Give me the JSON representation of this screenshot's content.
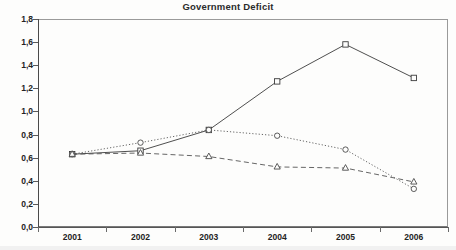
{
  "chart_data": {
    "type": "line",
    "title": "Government Deficit",
    "xlabel": "",
    "ylabel": "",
    "categories": [
      "2001",
      "2002",
      "2003",
      "2004",
      "2005",
      "2006"
    ],
    "ylim": [
      0.0,
      1.8
    ],
    "ytick_labels": [
      "0,0",
      "0,2",
      "0,4",
      "0,6",
      "0,8",
      "1,0",
      "1,2",
      "1,4",
      "1,6",
      "1,8"
    ],
    "ytick_values": [
      0.0,
      0.2,
      0.4,
      0.6,
      0.8,
      1.0,
      1.2,
      1.4,
      1.6,
      1.8
    ],
    "ytick_step": 0.2,
    "grid": false,
    "legend": "none",
    "decimal_separator": ",",
    "series": [
      {
        "name": "series-square-solid",
        "marker": "square",
        "line_style": "solid",
        "color": "#3b3b3b",
        "values": [
          0.63,
          0.66,
          0.84,
          1.26,
          1.58,
          1.29
        ]
      },
      {
        "name": "series-circle-dotted",
        "marker": "circle",
        "line_style": "dotted",
        "color": "#4a4a4a",
        "values": [
          0.63,
          0.73,
          0.84,
          0.79,
          0.67,
          0.33
        ]
      },
      {
        "name": "series-triangle-dashed",
        "marker": "triangle",
        "line_style": "dashed",
        "color": "#4a4a4a",
        "values": [
          0.63,
          0.64,
          0.61,
          0.52,
          0.51,
          0.39
        ]
      }
    ]
  }
}
